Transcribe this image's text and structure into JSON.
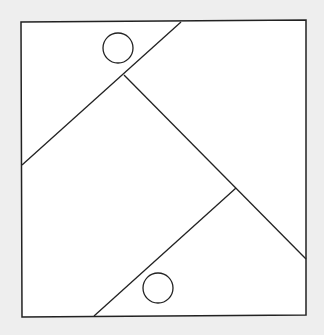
{
  "diagram": {
    "background_color": "#eeeeee",
    "fill_color": "#ffffff",
    "stroke_color": "#222222",
    "square": {
      "points": [
        [
          21,
          22
        ],
        [
          306,
          20
        ],
        [
          306,
          315
        ],
        [
          22,
          317
        ]
      ]
    },
    "segments": [
      {
        "id": "top-diagonal",
        "from": [
          181,
          22
        ],
        "to": [
          22,
          165
        ]
      },
      {
        "id": "long-diagonal",
        "from": [
          124,
          75
        ],
        "to": [
          306,
          259
        ]
      },
      {
        "id": "bottom-diagonal",
        "from": [
          236,
          188
        ],
        "to": [
          94,
          316
        ]
      }
    ],
    "circles": [
      {
        "id": "top-circle",
        "cx": 118,
        "cy": 48,
        "r": 15
      },
      {
        "id": "bottom-circle",
        "cx": 158,
        "cy": 288,
        "r": 15
      }
    ]
  }
}
